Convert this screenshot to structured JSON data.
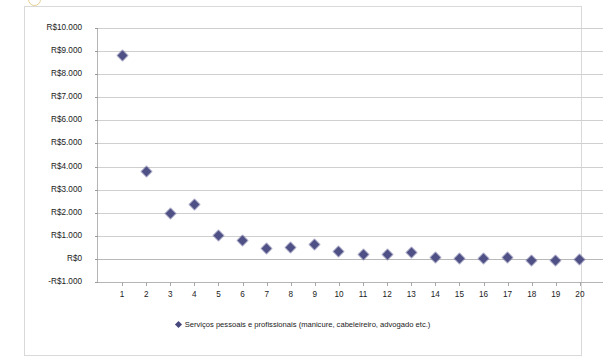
{
  "chart_data": {
    "type": "scatter",
    "title": "",
    "xlabel": "",
    "ylabel": "",
    "currency_prefix": "R$",
    "ylim": [
      -1000,
      10000
    ],
    "xlim": [
      0,
      21
    ],
    "grid": true,
    "legend_position": "bottom",
    "series": [
      {
        "name": "Serviços pessoais e profissionais (manicure, cabeleireiro, advogado etc.)",
        "color": "#46477d",
        "marker": "diamond",
        "x": [
          1,
          2,
          3,
          4,
          5,
          6,
          7,
          8,
          9,
          10,
          11,
          12,
          13,
          14,
          15,
          16,
          17,
          18,
          19,
          20
        ],
        "values": [
          8800,
          3800,
          1950,
          2350,
          1000,
          800,
          450,
          500,
          620,
          300,
          200,
          170,
          280,
          80,
          20,
          20,
          60,
          -50,
          -70,
          -40
        ]
      }
    ],
    "ytick_values": [
      10000,
      9000,
      8000,
      7000,
      6000,
      5000,
      4000,
      3000,
      2000,
      1000,
      0,
      -1000
    ],
    "ytick_labels": [
      "R$10.000",
      "R$9.000",
      "R$8.000",
      "R$7.000",
      "R$6.000",
      "R$5.000",
      "R$4.000",
      "R$3.000",
      "R$2.000",
      "R$1.000",
      "R$0",
      "-R$1.000"
    ],
    "xtick_labels": [
      "1",
      "2",
      "3",
      "4",
      "5",
      "6",
      "7",
      "8",
      "9",
      "10",
      "11",
      "12",
      "13",
      "14",
      "15",
      "16",
      "17",
      "18",
      "19",
      "20"
    ]
  },
  "legend": {
    "entries": [
      {
        "label": "Serviços pessoais e profissionais (manicure, cabeleireiro, advogado etc.)",
        "color": "#46477d"
      }
    ]
  }
}
